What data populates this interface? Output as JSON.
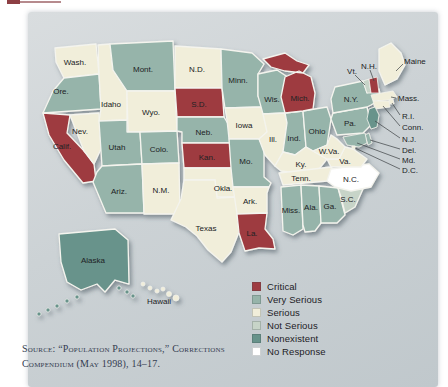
{
  "figure": {
    "kind": "choropleth-map",
    "region": "United States"
  },
  "legend": {
    "items": [
      {
        "key": "critical",
        "label": "Critical",
        "color": "#9E3B41"
      },
      {
        "key": "very-serious",
        "label": "Very Serious",
        "color": "#96B4AA"
      },
      {
        "key": "serious",
        "label": "Serious",
        "color": "#F1EEDA"
      },
      {
        "key": "not-serious",
        "label": "Not Serious",
        "color": "#C7D4C8"
      },
      {
        "key": "nonexistent",
        "label": "Nonexistent",
        "color": "#67938B"
      },
      {
        "key": "no-response",
        "label": "No Response",
        "color": "#FFFFFF"
      }
    ]
  },
  "source": {
    "citation": "Source: “Population Projections,” Corrections Compendium (May 1998), 14–17."
  },
  "chart_data": {
    "type": "choropleth",
    "region": "United States",
    "legend": [
      "Critical",
      "Very Serious",
      "Serious",
      "Not Serious",
      "Nonexistent",
      "No Response"
    ],
    "states": [
      {
        "id": "WA",
        "label": "Wash.",
        "status": "Serious"
      },
      {
        "id": "OR",
        "label": "Ore.",
        "status": "Very Serious"
      },
      {
        "id": "CA",
        "label": "Calif.",
        "status": "Critical"
      },
      {
        "id": "NV",
        "label": "Nev.",
        "status": "Serious"
      },
      {
        "id": "ID",
        "label": "Idaho",
        "status": "Serious"
      },
      {
        "id": "MT",
        "label": "Mont.",
        "status": "Very Serious"
      },
      {
        "id": "WY",
        "label": "Wyo.",
        "status": "Serious"
      },
      {
        "id": "UT",
        "label": "Utah",
        "status": "Very Serious"
      },
      {
        "id": "CO",
        "label": "Colo.",
        "status": "Very Serious"
      },
      {
        "id": "AZ",
        "label": "Ariz.",
        "status": "Very Serious"
      },
      {
        "id": "NM",
        "label": "N.M.",
        "status": "Serious"
      },
      {
        "id": "ND",
        "label": "N.D.",
        "status": "Serious"
      },
      {
        "id": "SD",
        "label": "S.D.",
        "status": "Critical"
      },
      {
        "id": "NE",
        "label": "Neb.",
        "status": "Very Serious"
      },
      {
        "id": "KS",
        "label": "Kan.",
        "status": "Critical"
      },
      {
        "id": "OK",
        "label": "Okla.",
        "status": "Serious"
      },
      {
        "id": "TX",
        "label": "Texas",
        "status": "Serious"
      },
      {
        "id": "MN",
        "label": "Minn.",
        "status": "Very Serious"
      },
      {
        "id": "IA",
        "label": "Iowa",
        "status": "Serious"
      },
      {
        "id": "MO",
        "label": "Mo.",
        "status": "Very Serious"
      },
      {
        "id": "AR",
        "label": "Ark.",
        "status": "Serious"
      },
      {
        "id": "LA",
        "label": "La.",
        "status": "Critical"
      },
      {
        "id": "WI",
        "label": "Wis.",
        "status": "Very Serious"
      },
      {
        "id": "IL",
        "label": "Ill.",
        "status": "Serious"
      },
      {
        "id": "IN",
        "label": "Ind.",
        "status": "Very Serious"
      },
      {
        "id": "OH",
        "label": "Ohio",
        "status": "Very Serious"
      },
      {
        "id": "MI",
        "label": "Mich.",
        "status": "Critical"
      },
      {
        "id": "KY",
        "label": "Ky.",
        "status": "Serious"
      },
      {
        "id": "TN",
        "label": "Tenn.",
        "status": "Serious"
      },
      {
        "id": "MS",
        "label": "Miss.",
        "status": "Very Serious"
      },
      {
        "id": "AL",
        "label": "Ala.",
        "status": "Very Serious"
      },
      {
        "id": "GA",
        "label": "Ga.",
        "status": "Very Serious"
      },
      {
        "id": "FL",
        "label": "Fla.",
        "status": "Nonexistent"
      },
      {
        "id": "SC",
        "label": "S.C.",
        "status": "Not Serious"
      },
      {
        "id": "NC",
        "label": "N.C.",
        "status": "No Response"
      },
      {
        "id": "VA",
        "label": "Va.",
        "status": "Serious"
      },
      {
        "id": "WV",
        "label": "W.Va.",
        "status": "Serious"
      },
      {
        "id": "PA",
        "label": "Pa.",
        "status": "Very Serious"
      },
      {
        "id": "NY",
        "label": "N.Y.",
        "status": "Very Serious"
      },
      {
        "id": "VT",
        "label": "Vt.",
        "status": "Not Serious"
      },
      {
        "id": "NH",
        "label": "N.H.",
        "status": "Critical"
      },
      {
        "id": "ME",
        "label": "Maine",
        "status": "Serious"
      },
      {
        "id": "MA",
        "label": "Mass.",
        "status": "Serious"
      },
      {
        "id": "RI",
        "label": "R.I.",
        "status": "Serious"
      },
      {
        "id": "CT",
        "label": "Conn.",
        "status": "Serious"
      },
      {
        "id": "NJ",
        "label": "N.J.",
        "status": "Nonexistent"
      },
      {
        "id": "DE",
        "label": "Del.",
        "status": "Very Serious"
      },
      {
        "id": "MD",
        "label": "Md.",
        "status": "Very Serious"
      },
      {
        "id": "DC",
        "label": "D.C.",
        "status": "Serious"
      },
      {
        "id": "AK",
        "label": "Alaska",
        "status": "Nonexistent"
      },
      {
        "id": "HI",
        "label": "Hawaii",
        "status": "Serious"
      }
    ]
  }
}
